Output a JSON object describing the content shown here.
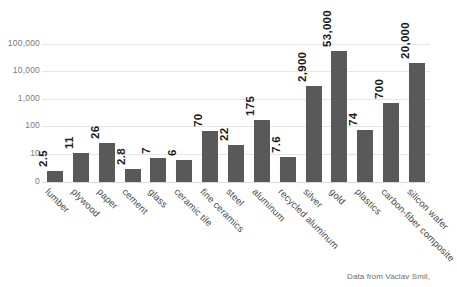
{
  "chart_data": {
    "type": "bar",
    "title": "",
    "subtitle": "",
    "xlabel": "",
    "ylabel": "",
    "yscale": "log",
    "ylim": [
      0,
      100000
    ],
    "grid": true,
    "legend": "none",
    "categories": [
      "lumber",
      "plywood",
      "paper",
      "cement",
      "glass",
      "ceramic tile",
      "fine ceramics",
      "steel",
      "aluminum",
      "recycled aluminum",
      "silver",
      "gold",
      "plastics",
      "carbon-fiber composite",
      "silicon wafer"
    ],
    "values": [
      2.5,
      11,
      26,
      2.8,
      7,
      6,
      70,
      22,
      175,
      7.6,
      2900,
      53000,
      74,
      700,
      20000
    ],
    "value_labels": [
      "2.5",
      "11",
      "26",
      "2.8",
      "7",
      "6",
      "70",
      "22",
      "175",
      "7.6",
      "2,900",
      "53,000",
      "74",
      "700",
      "20,000"
    ],
    "ytick_labels": [
      "0",
      "10",
      "100",
      "1,000",
      "10,000",
      "100,000"
    ],
    "ytick_values": [
      0,
      10,
      100,
      1000,
      10000,
      100000
    ],
    "bar_color": "#595959",
    "gridline_color": "#e6e6e6",
    "value_label_color": "#1a1a1a",
    "tick_label_color": "#7a7a7a",
    "category_label_color": "#4a4a4a",
    "background_color": "#ffffff",
    "annotations": [
      {
        "name": "source-note",
        "text": "Data from Vaclav Smil,"
      }
    ]
  },
  "source": {
    "text": "Data from Vaclav Smil,"
  }
}
